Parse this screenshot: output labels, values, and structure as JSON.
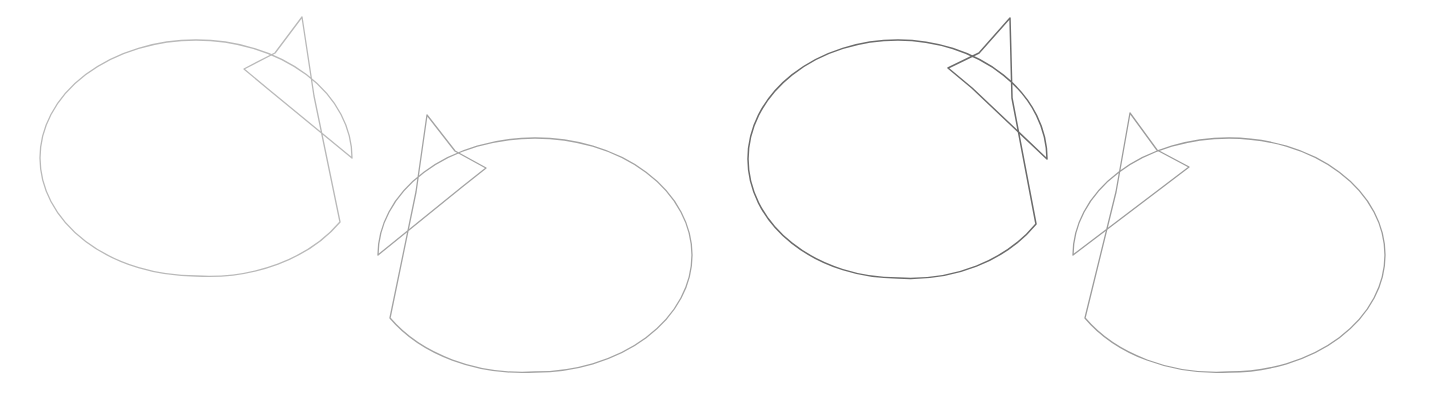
{
  "canvas": {
    "width": 1432,
    "height": 400,
    "background_color": "#ffffff",
    "description": "Four outlined speech-bubble shapes, each an ellipse with a pointed tail spike, drawn in thin gray strokes on a plain white background."
  },
  "shapes": [
    {
      "id": "bubble-1",
      "label": "Speech bubble 1",
      "order": 1,
      "stroke_color": "#b9b9b9",
      "stroke_width": 1.3,
      "fill": "none",
      "tail_side": "top-right",
      "tail_direction": "up-right",
      "ellipse": {
        "cx": 196,
        "cy": 158,
        "rx": 156,
        "ry": 118
      },
      "bounds": {
        "x": 40,
        "y": 17,
        "width": 312,
        "height": 258
      },
      "tail_tip": {
        "x": 302,
        "y": 17
      },
      "path": "M 352 158 A 156 118 0 0 0 196 40 A 156 118 0 0 0 40 158 A 156 118 0 0 0 196 276 A 156 118 0 0 0 340 222 L 314 96 L 302 17 L 275 53 L 244 69 L 268 89 Z"
    },
    {
      "id": "bubble-2",
      "label": "Speech bubble 2",
      "order": 2,
      "stroke_color": "#a3a3a3",
      "stroke_width": 1.3,
      "fill": "none",
      "tail_side": "top-left",
      "tail_direction": "up-left",
      "ellipse": {
        "cx": 535,
        "cy": 255,
        "rx": 157,
        "ry": 117
      },
      "bounds": {
        "x": 378,
        "y": 115,
        "width": 314,
        "height": 257
      },
      "tail_tip": {
        "x": 427,
        "y": 115
      },
      "path": "M 378 255 A 157 117 0 0 1 535 138 A 157 117 0 0 1 692 255 A 157 117 0 0 1 535 372 A 157 117 0 0 1 390 318 L 416 192 L 427 115 L 455 151 L 486 168 L 462 187 Z"
    },
    {
      "id": "bubble-3",
      "label": "Speech bubble 3",
      "order": 3,
      "stroke_color": "#6b6b6b",
      "stroke_width": 1.5,
      "fill": "none",
      "tail_side": "top-right",
      "tail_direction": "up-right",
      "ellipse": {
        "cx": 898,
        "cy": 159,
        "rx": 150,
        "ry": 119
      },
      "bounds": {
        "x": 748,
        "y": 18,
        "width": 299,
        "height": 260
      },
      "tail_tip": {
        "x": 1010,
        "y": 18
      },
      "path": "M 1047 159 A 150 119 0 0 0 898 40 A 150 119 0 0 0 748 159 A 150 119 0 0 0 898 278 A 150 119 0 0 0 1036 224 L 1012 98 L 1010 18 L 979 53 L 948 68 L 972 88 Z"
    },
    {
      "id": "bubble-4",
      "label": "Speech bubble 4",
      "order": 4,
      "stroke_color": "#9c9c9c",
      "stroke_width": 1.3,
      "fill": "none",
      "tail_side": "top-left",
      "tail_direction": "up-left",
      "ellipse": {
        "cx": 1229,
        "cy": 255,
        "rx": 156,
        "ry": 117
      },
      "bounds": {
        "x": 1073,
        "y": 113,
        "width": 312,
        "height": 259
      },
      "tail_tip": {
        "x": 1130,
        "y": 113
      },
      "path": "M 1073 255 A 156 117 0 0 1 1229 138 A 156 117 0 0 1 1385 255 A 156 117 0 0 1 1229 372 A 156 117 0 0 1 1085 318 L 1116 192 L 1130 113 L 1157 150 L 1189 167 L 1164 186 Z"
    }
  ]
}
